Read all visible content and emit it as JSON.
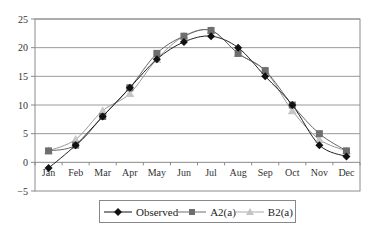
{
  "chart_data": {
    "type": "line",
    "title": "",
    "xlabel": "",
    "ylabel": "",
    "categories": [
      "Jan",
      "Feb",
      "Mar",
      "Apr",
      "May",
      "Jun",
      "Jul",
      "Aug",
      "Sep",
      "Oct",
      "Nov",
      "Dec"
    ],
    "ylim": [
      -5,
      25
    ],
    "yticks": [
      -5,
      0,
      5,
      10,
      15,
      20,
      25
    ],
    "grid": true,
    "legend_position": "bottom",
    "series": [
      {
        "name": "Observed",
        "marker": "diamond",
        "color": "#111111",
        "values": [
          -1,
          3,
          8,
          13,
          18,
          21,
          22,
          20,
          15,
          10,
          3,
          1
        ]
      },
      {
        "name": "A2(a)",
        "marker": "square",
        "color": "#6e6e6e",
        "values": [
          2,
          3,
          8,
          13,
          19,
          22,
          23,
          19,
          16,
          10,
          5,
          2
        ]
      },
      {
        "name": "B2(a)",
        "marker": "triangle",
        "color": "#b4b4b4",
        "values": [
          2,
          4,
          9,
          12,
          18,
          22,
          23,
          19,
          16,
          9,
          4,
          2
        ]
      }
    ]
  },
  "legend": {
    "items": [
      "Observed",
      "A2(a)",
      "B2(a)"
    ]
  }
}
